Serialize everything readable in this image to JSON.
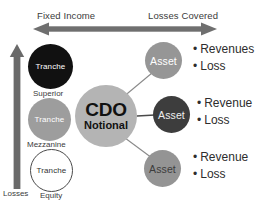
{
  "header": {
    "left_label": "Fixed Income",
    "right_label": "Losses Covered",
    "arrow_icon": "double-headed-horizontal-arrow-icon"
  },
  "axis": {
    "vertical_arrow_icon": "up-arrow-icon",
    "bottom_label": "Losses"
  },
  "tranches": [
    {
      "id": "superior",
      "text": "Tranche",
      "label": "Superior",
      "color": "#111111",
      "text_color": "#ffffff"
    },
    {
      "id": "mezzanine",
      "text": "Tranche",
      "label": "Mezzanine",
      "color": "#9d9d9d",
      "text_color": "#ffffff"
    },
    {
      "id": "equity",
      "text": "Tranche",
      "label": "Equity",
      "color": "#ffffff",
      "text_color": "#333333"
    }
  ],
  "center": {
    "title": "CDO",
    "subtitle": "Notional",
    "color": "#b4b4b4"
  },
  "assets": [
    {
      "id": "asset-1",
      "text": "Asset",
      "color": "#969696",
      "text_color": "#ffffff",
      "bullets": [
        "Revenues",
        "Loss"
      ]
    },
    {
      "id": "asset-2",
      "text": "Asset",
      "color": "#3d3d3d",
      "text_color": "#eeeeee",
      "bullets": [
        "Revenue",
        "Loss"
      ]
    },
    {
      "id": "asset-3",
      "text": "Asset",
      "color": "#949494",
      "text_color": "#3c3c3c",
      "bullets": [
        "Revenue",
        "Loss"
      ]
    }
  ],
  "bullet_marker": "•",
  "palette": {
    "arrow_gray": "#6f6f6f",
    "connector_gray": "#8a8a8a",
    "text_dark": "#2d2d2d",
    "background": "#ffffff"
  }
}
